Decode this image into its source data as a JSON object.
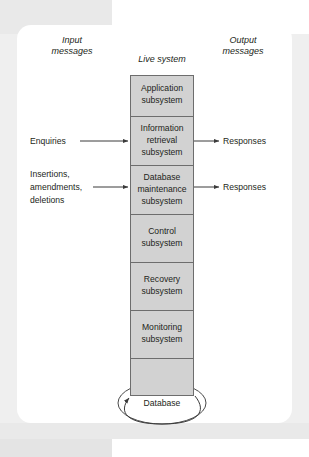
{
  "figure": {
    "type": "block-diagram",
    "columns": {
      "input_header": "Input\nmessages",
      "input_header_line1": "Input",
      "input_header_line2": "messages",
      "center_header": "Live system",
      "output_header_line1": "Output",
      "output_header_line2": "messages"
    },
    "subsystems": [
      {
        "id": "application",
        "line1": "Application",
        "line2": "subsystem",
        "line3": ""
      },
      {
        "id": "information-retrieval",
        "line1": "Information",
        "line2": "retrieval",
        "line3": "subsystem"
      },
      {
        "id": "database-maintenance",
        "line1": "Database",
        "line2": "maintenance",
        "line3": "subsystem"
      },
      {
        "id": "control",
        "line1": "Control",
        "line2": "subsystem",
        "line3": ""
      },
      {
        "id": "recovery",
        "line1": "Recovery",
        "line2": "subsystem",
        "line3": ""
      },
      {
        "id": "monitoring",
        "line1": "Monitoring",
        "line2": "subsystem",
        "line3": ""
      },
      {
        "id": "unlabelled",
        "line1": "",
        "line2": "",
        "line3": ""
      }
    ],
    "input_flows": [
      {
        "id": "enquiries",
        "line1": "Enquiries",
        "line2": "",
        "line3": "",
        "target": "information-retrieval"
      },
      {
        "id": "insertions-amendments-deletions",
        "line1": "Insertions,",
        "line2": "amendments,",
        "line3": "deletions",
        "target": "database-maintenance"
      }
    ],
    "output_flows": [
      {
        "id": "responses-retrieval",
        "label": "Responses",
        "source": "information-retrieval"
      },
      {
        "id": "responses-maintenance",
        "label": "Responses",
        "source": "database-maintenance"
      }
    ],
    "datastore": {
      "id": "database",
      "label": "Database"
    },
    "colors": {
      "box_fill": "#d2d2d2",
      "box_stroke": "#6d6d6d",
      "line": "#3a3a3a",
      "card": "#ffffff",
      "page_background": "#efefef",
      "text": "#231f20"
    }
  }
}
